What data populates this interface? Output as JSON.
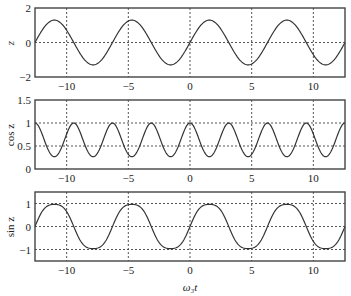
{
  "chart_data": [
    {
      "type": "line",
      "panel": "top",
      "title": "",
      "xlabel": "",
      "ylabel": "z",
      "xlim": [
        -12.566,
        12.566
      ],
      "ylim": [
        -2,
        2
      ],
      "xticks": [
        -10,
        -5,
        0,
        5,
        10
      ],
      "xtick_labels": [
        "−10",
        "−5",
        "0",
        "5",
        "10"
      ],
      "yticks": [
        -2,
        0,
        2
      ],
      "ytick_labels": [
        "−2",
        "0",
        "2"
      ],
      "grid": {
        "x": [
          -10,
          -5,
          0,
          5,
          10
        ],
        "y": [
          0
        ],
        "style": "dotted"
      },
      "series": [
        {
          "name": "z",
          "function": "1.3*sin(x)",
          "amplitude": 1.3,
          "x": [
            -12.566,
            -11.0,
            -9.42,
            -7.85,
            -6.28,
            -4.71,
            -3.14,
            -1.57,
            0,
            1.57,
            3.14,
            4.71,
            6.28,
            7.85,
            9.42,
            11.0,
            12.566
          ],
          "values": [
            0,
            1.3,
            0,
            -1.3,
            0,
            1.3,
            0,
            -1.3,
            0,
            1.3,
            0,
            -1.3,
            0,
            1.3,
            0,
            -1.3,
            0
          ]
        }
      ]
    },
    {
      "type": "line",
      "panel": "middle",
      "title": "",
      "xlabel": "",
      "ylabel": "cos z",
      "xlim": [
        -12.566,
        12.566
      ],
      "ylim": [
        0,
        1.5
      ],
      "xticks": [
        -10,
        -5,
        0,
        5,
        10
      ],
      "xtick_labels": [
        "−10",
        "−5",
        "0",
        "5",
        "10"
      ],
      "yticks": [
        0,
        0.5,
        1,
        1.5
      ],
      "ytick_labels": [
        "0",
        "0.5",
        "1",
        "1.5"
      ],
      "grid": {
        "x": [
          -10,
          -5,
          0,
          5,
          10
        ],
        "y": [
          0.5,
          1
        ],
        "style": "dotted"
      },
      "series": [
        {
          "name": "cos z",
          "function": "cos(1.3*sin(x))",
          "x": [
            -12.566,
            -11.0,
            -9.42,
            -7.85,
            -6.28,
            -4.71,
            -3.14,
            -1.57,
            0,
            1.57,
            3.14,
            4.71,
            6.28,
            7.85,
            9.42,
            11.0,
            12.566
          ],
          "values": [
            1,
            0.27,
            1,
            0.27,
            1,
            0.27,
            1,
            0.27,
            1,
            0.27,
            1,
            0.27,
            1,
            0.27,
            1,
            0.27,
            1
          ]
        }
      ]
    },
    {
      "type": "line",
      "panel": "bottom",
      "title": "",
      "xlabel": "ω₃t",
      "ylabel": "sin z",
      "xlim": [
        -12.566,
        12.566
      ],
      "ylim": [
        -1.5,
        1.5
      ],
      "xticks": [
        -10,
        -5,
        0,
        5,
        10
      ],
      "xtick_labels": [
        "−10",
        "−5",
        "0",
        "5",
        "10"
      ],
      "yticks": [
        -1,
        0,
        1
      ],
      "ytick_labels": [
        "−1",
        "0",
        "1"
      ],
      "grid": {
        "x": [
          -10,
          -5,
          0,
          5,
          10
        ],
        "y": [
          -1,
          0,
          1
        ],
        "style": "dotted"
      },
      "series": [
        {
          "name": "sin z",
          "function": "sin(1.3*sin(x))",
          "x": [
            -12.566,
            -11.0,
            -9.42,
            -7.85,
            -6.28,
            -4.71,
            -3.14,
            -1.57,
            0,
            1.57,
            3.14,
            4.71,
            6.28,
            7.85,
            9.42,
            11.0,
            12.566
          ],
          "values": [
            0,
            0.96,
            0,
            -0.96,
            0,
            0.96,
            0,
            -0.96,
            0,
            0.96,
            0,
            -0.96,
            0,
            0.96,
            0,
            -0.96,
            0
          ]
        }
      ]
    }
  ],
  "labels": {
    "panel1_ylabel": "z",
    "panel2_ylabel": "cos z",
    "panel3_ylabel": "sin z",
    "xlabel": "ω₃t"
  },
  "style": {
    "line_color": "#333333",
    "frame_color": "#444444",
    "grid_color": "#555555"
  },
  "layout": {
    "frame_left": 35,
    "frame_right": 345,
    "panels": [
      {
        "top": 8,
        "bottom": 77
      },
      {
        "top": 100,
        "bottom": 169
      },
      {
        "top": 192,
        "bottom": 261
      }
    ]
  }
}
